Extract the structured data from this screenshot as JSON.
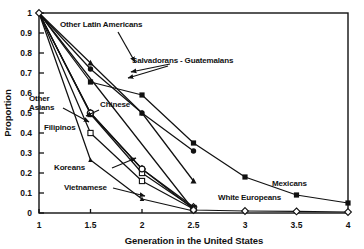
{
  "chart_data": {
    "type": "line",
    "title": "",
    "xlabel": "Generation in the United States",
    "ylabel": "Proportion",
    "xlim": [
      1,
      4
    ],
    "ylim": [
      0,
      1
    ],
    "xticks": [
      "1",
      "1.5",
      "2",
      "2.5",
      "3",
      "3.5",
      "4"
    ],
    "xtick_values": [
      1,
      1.5,
      2,
      2.5,
      3,
      3.5,
      4
    ],
    "yticks": [
      "0",
      "0.1",
      "0.2",
      "0.3",
      "0.4",
      "0.5",
      "0.6",
      "0.7",
      "0.8",
      "0.9",
      "1"
    ],
    "ytick_values": [
      0,
      0.1,
      0.2,
      0.3,
      0.4,
      0.5,
      0.6,
      0.7,
      0.8,
      0.9,
      1
    ],
    "grid": false,
    "legend": "inline-annotations",
    "series": [
      {
        "name": "Mexicans",
        "marker": "square",
        "x": [
          1,
          1.5,
          2,
          2.5,
          3,
          3.5,
          4
        ],
        "values": [
          1.0,
          0.655,
          0.59,
          0.35,
          0.18,
          0.09,
          0.05
        ]
      },
      {
        "name": "Salvadorans - Guatemalans",
        "marker": "circle-filled",
        "x": [
          1,
          1.5,
          2,
          2.5
        ],
        "values": [
          1.0,
          0.72,
          0.5,
          0.31
        ]
      },
      {
        "name": "Other Latin Americans",
        "marker": "triangle",
        "x": [
          1,
          1.5,
          2,
          2.5
        ],
        "values": [
          1.0,
          0.75,
          0.5,
          0.16
        ]
      },
      {
        "name": "Chinese",
        "marker": "diamond-open",
        "x": [
          1,
          1.5,
          2,
          2.5
        ],
        "values": [
          1.0,
          0.5,
          0.22,
          0.03
        ]
      },
      {
        "name": "Other Asians",
        "marker": "square-open",
        "x": [
          1,
          1.5,
          2,
          2.5
        ],
        "values": [
          1.0,
          0.495,
          0.2,
          0.025
        ]
      },
      {
        "name": "Filipinos",
        "marker": "square-open",
        "x": [
          1,
          1.5,
          2,
          2.5
        ],
        "values": [
          1.0,
          0.4,
          0.16,
          0.02
        ]
      },
      {
        "name": "Koreans",
        "marker": "circle-open",
        "x": [
          1,
          1.5,
          2,
          2.5
        ],
        "values": [
          1.0,
          0.5,
          0.22,
          0.02
        ]
      },
      {
        "name": "Vietnamese",
        "marker": "triangle-small",
        "x": [
          1,
          1.5,
          2,
          2.5
        ],
        "values": [
          1.0,
          0.265,
          0.07,
          0.01
        ]
      },
      {
        "name": "White Europeans",
        "marker": "diamond-open",
        "x": [
          1,
          2.5,
          3,
          3.5,
          4
        ],
        "values": [
          1.0,
          0.015,
          0.01,
          0.008,
          0.005
        ]
      }
    ],
    "annotations": [
      {
        "text": "Other Latin Americans",
        "x_px": 60,
        "y_px": 27
      },
      {
        "text": "Salvadorans - Guatemalans",
        "x_px": 132,
        "y_px": 63
      },
      {
        "text": "Other",
        "x_px": 29,
        "y_px": 101
      },
      {
        "text": "Asians",
        "x_px": 29,
        "y_px": 110
      },
      {
        "text": "Chinese",
        "x_px": 100,
        "y_px": 107
      },
      {
        "text": "Filipinos",
        "x_px": 44,
        "y_px": 130
      },
      {
        "text": "Koreans",
        "x_px": 54,
        "y_px": 170
      },
      {
        "text": "Vietnamese",
        "x_px": 64,
        "y_px": 190
      },
      {
        "text": "Mexicans",
        "x_px": 272,
        "y_px": 186
      },
      {
        "text": "White Europeans",
        "x_px": 218,
        "y_px": 200
      }
    ]
  },
  "colors": {
    "line": "#111111",
    "axis": "#111111",
    "text": "#111111",
    "background": "#ffffff",
    "marker_fill_open": "#ffffff"
  }
}
